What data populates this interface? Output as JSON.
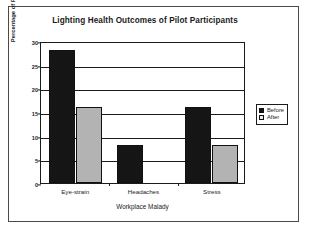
{
  "chart_data": {
    "type": "bar",
    "title": "Lighting Health Outcomes of Pilot Participants",
    "xlabel": "Workplace Malady",
    "ylabel": "Percentage of Pilot Participants w/ Malady",
    "categories": [
      "Eye-strain",
      "Headaches",
      "Stress"
    ],
    "series": [
      {
        "name": "Before",
        "color": "#151515",
        "values": [
          28,
          8,
          16
        ]
      },
      {
        "name": "After",
        "color": "#b3b3b3",
        "values": [
          16,
          null,
          8
        ]
      }
    ],
    "ylim": [
      0,
      30
    ],
    "yticks": [
      0,
      5,
      10,
      15,
      20,
      25,
      30
    ],
    "ytick_labels": [
      "0",
      "5",
      "10",
      "15",
      "20",
      "25",
      "30"
    ],
    "grid": true,
    "legend_position": "right",
    "legend_entries": [
      "Before",
      "After"
    ]
  },
  "frame": {
    "border_color": "#4a4a4a",
    "axis_color": "#1b1b1b"
  }
}
